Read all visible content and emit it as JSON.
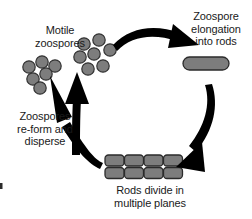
{
  "diagram": {
    "background_color": "#ffffff",
    "shape_fill_color": "#7d7d7d",
    "shape_outline_color": "#2b2b2b",
    "arrow_color": "#000000",
    "text_color": "#1a1a1a"
  },
  "labels": {
    "motile_zoospores": "Motile\nzoospores",
    "zoospore_elongation": "Zoospore\nelongation\ninto rods",
    "rods_divide": "Rods divide in\nmultiple planes",
    "zoospores_reform": "Zoospores\nre-form and\ndisperse"
  },
  "stages": [
    {
      "name": "motile-zoospores",
      "label": "Motile zoospores",
      "shape": "circles",
      "count": 13,
      "clusters": [
        {
          "name": "left-cluster",
          "count": 6,
          "circles": [
            {
              "cx": 29,
              "cy": 67,
              "r": 6.2
            },
            {
              "cx": 42,
              "cy": 62,
              "r": 6.2
            },
            {
              "cx": 55,
              "cy": 66,
              "r": 6.2
            },
            {
              "cx": 33,
              "cy": 79,
              "r": 6.2
            },
            {
              "cx": 46,
              "cy": 74,
              "r": 6.2
            },
            {
              "cx": 40,
              "cy": 88,
              "r": 6.2
            }
          ]
        },
        {
          "name": "right-cluster",
          "count": 7,
          "circles": [
            {
              "cx": 84,
              "cy": 44,
              "r": 6.2
            },
            {
              "cx": 99,
              "cy": 40,
              "r": 6.2
            },
            {
              "cx": 80,
              "cy": 57,
              "r": 6.2
            },
            {
              "cx": 94,
              "cy": 54,
              "r": 6.2
            },
            {
              "cx": 110,
              "cy": 50,
              "r": 6.2
            },
            {
              "cx": 88,
              "cy": 69,
              "r": 6.2
            },
            {
              "cx": 103,
              "cy": 66,
              "r": 6.2
            }
          ]
        }
      ]
    },
    {
      "name": "zoospore-elongation-into-rods",
      "label": "Zoospore elongation into rods",
      "shape": "rod",
      "count": 1,
      "rod": {
        "x": 183,
        "y": 57,
        "width": 46,
        "height": 13,
        "rx": 6.5
      }
    },
    {
      "name": "rods-divide-multiple-planes",
      "label": "Rods divide in multiple planes",
      "shape": "rod-grid",
      "columns": 4,
      "rows": 2,
      "count": 8,
      "grid": {
        "x": 105,
        "y": 155,
        "cell_width": 19,
        "cell_height": 11,
        "gap_x": 0.5,
        "gap_y": 1.5,
        "rx": 3.5
      }
    }
  ],
  "arrows": [
    {
      "name": "arrow-zoospores-to-rod",
      "from": "motile-zoospores",
      "to": "zoospore-elongation-into-rods",
      "direction": "clockwise-top"
    },
    {
      "name": "arrow-rod-to-division",
      "from": "zoospore-elongation-into-rods",
      "to": "rods-divide-multiple-planes",
      "direction": "clockwise-right"
    },
    {
      "name": "arrow-division-to-zoospores-left",
      "from": "rods-divide-multiple-planes",
      "to": "motile-zoospores",
      "direction": "counterclockwise-left-long"
    },
    {
      "name": "arrow-division-to-zoospores-right",
      "from": "rods-divide-multiple-planes",
      "to": "motile-zoospores",
      "direction": "counterclockwise-left-short"
    }
  ]
}
